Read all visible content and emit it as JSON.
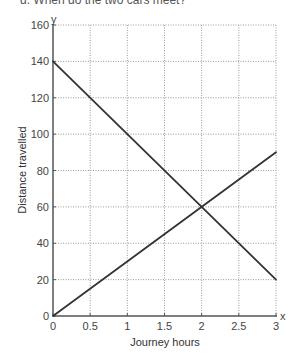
{
  "question": {
    "text": "d. When do the two cars meet?"
  },
  "chart_data": {
    "type": "line",
    "title": "",
    "xlabel": "Journey hours",
    "ylabel": "Distance travelled",
    "x_axis_letter": "x",
    "y_axis_letter": "y",
    "xlim": [
      0,
      3
    ],
    "ylim": [
      0,
      160
    ],
    "x_ticks": [
      0,
      0.5,
      1,
      1.5,
      2,
      2.5,
      3
    ],
    "x_tick_labels": [
      "0",
      "0.5",
      "1",
      "1.5",
      "2",
      "2.5",
      "3"
    ],
    "y_ticks": [
      0,
      20,
      40,
      60,
      80,
      100,
      120,
      140,
      160
    ],
    "y_tick_labels": [
      "0",
      "20",
      "40",
      "60",
      "80",
      "100",
      "120",
      "140",
      "160"
    ],
    "grid": true,
    "legend": null,
    "series": [
      {
        "name": "Car A (increasing)",
        "x": [
          0,
          3
        ],
        "y": [
          0,
          90
        ],
        "color": "#333333"
      },
      {
        "name": "Car B (decreasing)",
        "x": [
          0,
          3
        ],
        "y": [
          140,
          20
        ],
        "color": "#333333"
      }
    ],
    "intersection": {
      "x": 2,
      "y": 60
    }
  },
  "colors": {
    "axis": "#555555",
    "grid": "#9a9a9a",
    "line": "#333333"
  }
}
